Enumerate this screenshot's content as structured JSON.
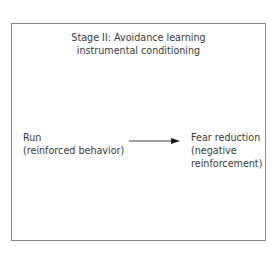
{
  "diagram": {
    "title_lines": [
      "Stage II: Avoidance learning",
      "instrumental conditioning"
    ],
    "source_node": {
      "lines": [
        "Run",
        "(reinforced behavior)"
      ]
    },
    "target_node": {
      "lines": [
        "Fear reduction",
        "(negative",
        "reinforcement)"
      ]
    },
    "edge": {
      "from": "source_node",
      "to": "target_node",
      "type": "arrow"
    },
    "colors": {
      "border": "#8a8a8a",
      "text": "#3a3a3a",
      "arrow": "#1a1a1a"
    }
  }
}
